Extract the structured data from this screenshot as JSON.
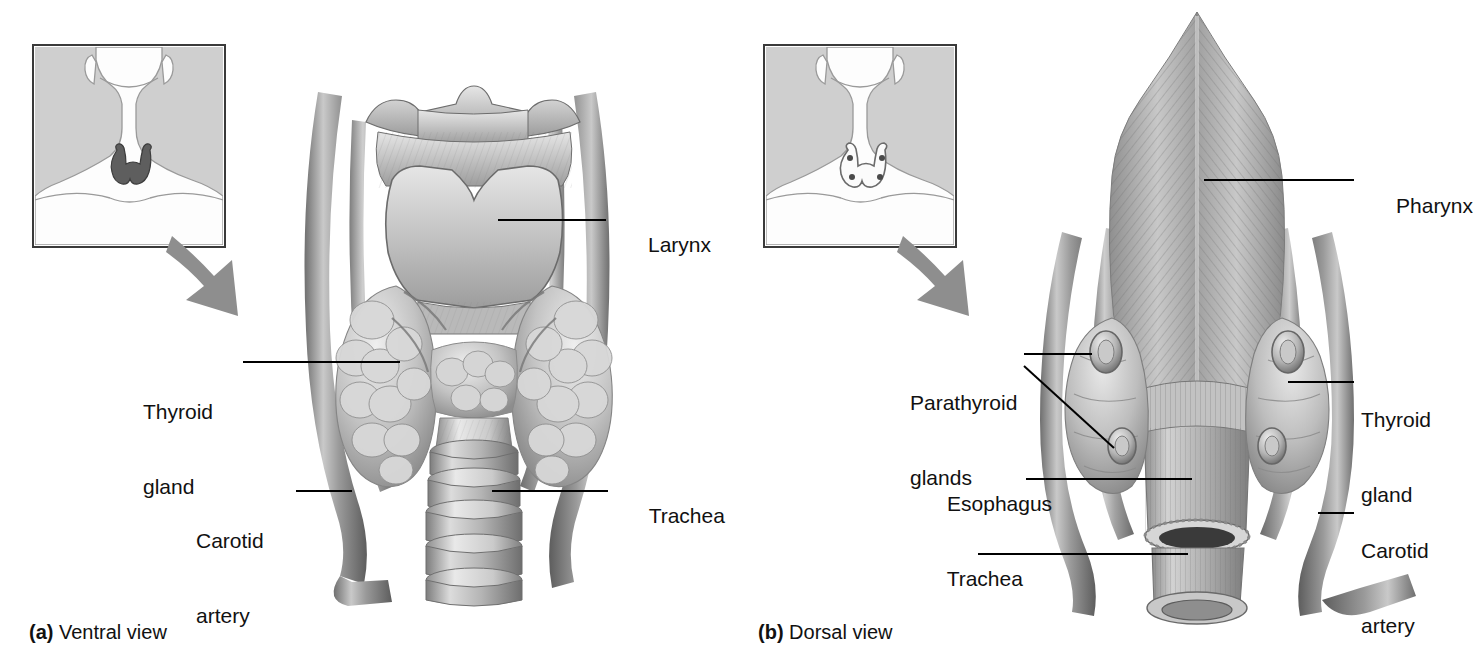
{
  "figure": {
    "background_color": "#ffffff",
    "text_color": "#111111",
    "accent_gray": "#8e8e8e"
  },
  "panel_a": {
    "caption_marker": "(a)",
    "caption_text": " Ventral view",
    "inset": {
      "name": "neck-locator-ventral",
      "background_color": "#cfcfcf",
      "structure_shown": "thyroid gland"
    },
    "arrow": {
      "name": "zoom-arrow",
      "direction": "down-right",
      "color": "#8e8e8e"
    },
    "labels": [
      {
        "id": "larynx",
        "text": "Larynx",
        "text2": "",
        "side": "right"
      },
      {
        "id": "thyroid-gland",
        "text": "Thyroid",
        "text2": "gland",
        "side": "left"
      },
      {
        "id": "carotid-artery",
        "text": "Carotid",
        "text2": "artery",
        "side": "left"
      },
      {
        "id": "trachea",
        "text": "Trachea",
        "text2": "",
        "side": "right"
      }
    ]
  },
  "panel_b": {
    "caption_marker": "(b)",
    "caption_text": " Dorsal view",
    "inset": {
      "name": "neck-locator-dorsal",
      "background_color": "#cfcfcf",
      "structure_shown": "thyroid outline with four parathyroid glands"
    },
    "arrow": {
      "name": "zoom-arrow",
      "direction": "down-right",
      "color": "#8e8e8e"
    },
    "labels": [
      {
        "id": "pharynx",
        "text": "Pharynx",
        "text2": "",
        "side": "right"
      },
      {
        "id": "thyroid-gland",
        "text": "Thyroid",
        "text2": "gland",
        "side": "right"
      },
      {
        "id": "carotid-artery",
        "text": "Carotid",
        "text2": "artery",
        "side": "right"
      },
      {
        "id": "parathyroid-glands",
        "text": "Parathyroid",
        "text2": "glands",
        "side": "left"
      },
      {
        "id": "esophagus",
        "text": "Esophagus",
        "text2": "",
        "side": "left"
      },
      {
        "id": "trachea",
        "text": "Trachea",
        "text2": "",
        "side": "left"
      }
    ]
  }
}
